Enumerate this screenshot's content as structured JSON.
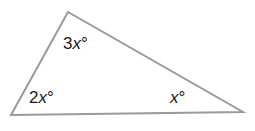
{
  "diagram": {
    "type": "triangle",
    "stroke_color": "#9a9a9a",
    "vertices": {
      "top": [
        68,
        12
      ],
      "bottom_left": [
        11,
        115
      ],
      "bottom_right": [
        243,
        112
      ]
    },
    "angles": [
      {
        "vertex": "top",
        "coef": "3",
        "var": "x",
        "unit": "°"
      },
      {
        "vertex": "bottom_left",
        "coef": "2",
        "var": "x",
        "unit": "°"
      },
      {
        "vertex": "bottom_right",
        "coef": "",
        "var": "x",
        "unit": "°"
      }
    ]
  }
}
